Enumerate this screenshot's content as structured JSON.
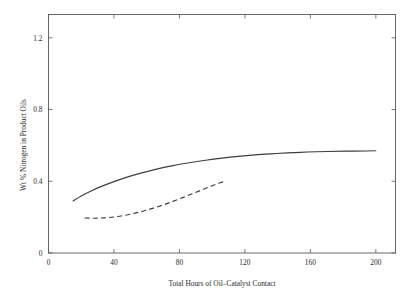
{
  "chart_data": {
    "type": "line",
    "title": "",
    "subtitle": "",
    "xlabel": "Total Hours of Oil–Catalyst Contact",
    "ylabel": "Wt % Nitrogen in Product Oils",
    "xlim": [
      0,
      212
    ],
    "ylim": [
      0,
      1.33
    ],
    "xticks": [
      0,
      40,
      80,
      120,
      160,
      200
    ],
    "xtick_labels": [
      "0",
      "40",
      "80",
      "120",
      "160",
      "200"
    ],
    "yticks": [
      0,
      0.4,
      0.8,
      1.2
    ],
    "ytick_labels": [
      "0",
      "0.4",
      "0.8",
      "1.2"
    ],
    "grid": false,
    "legend": "none",
    "frame": "box",
    "tick_direction": "in",
    "series": [
      {
        "name": "solid-curve",
        "style": "solid",
        "color": "#3a3f44",
        "x": [
          15,
          20,
          26,
          32,
          40,
          48,
          57,
          66,
          76,
          86,
          96,
          106,
          116,
          126,
          136,
          146,
          158,
          170,
          182,
          194,
          200
        ],
        "y": [
          0.29,
          0.318,
          0.346,
          0.37,
          0.398,
          0.423,
          0.447,
          0.468,
          0.487,
          0.503,
          0.517,
          0.529,
          0.539,
          0.547,
          0.553,
          0.558,
          0.563,
          0.566,
          0.568,
          0.569,
          0.57
        ]
      },
      {
        "name": "dashed-curve",
        "style": "dashed",
        "color": "#3a3f44",
        "x": [
          22,
          28,
          34,
          40,
          46,
          52,
          58,
          64,
          70,
          76,
          82,
          88,
          94,
          100,
          105,
          108
        ],
        "y": [
          0.195,
          0.194,
          0.196,
          0.201,
          0.209,
          0.22,
          0.234,
          0.25,
          0.268,
          0.288,
          0.309,
          0.331,
          0.353,
          0.375,
          0.392,
          0.4
        ]
      }
    ]
  }
}
